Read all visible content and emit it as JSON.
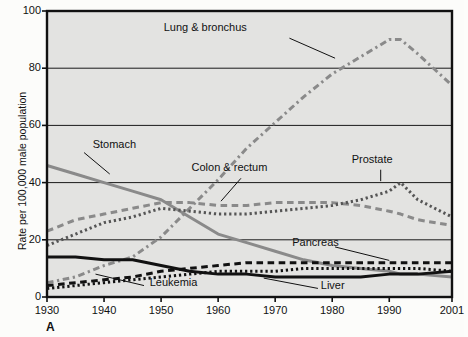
{
  "figure": {
    "panel_letter": "A",
    "background": "#e3e3e1",
    "frame_color": "#111111"
  },
  "axes": {
    "ylabel": "Rate per 100,000 male population",
    "xlabel": "",
    "yticks": [
      "0",
      "20",
      "40",
      "60",
      "80",
      "100"
    ],
    "xticks": [
      "1930",
      "1940",
      "1950",
      "1960",
      "1970",
      "1980",
      "1990",
      "2001"
    ]
  },
  "labels": {
    "lung": "Lung & bronchus",
    "stomach": "Stomach",
    "colon": "Colon & rectum",
    "prostate": "Prostate",
    "pancreas": "Pancreas",
    "leukemia": "Leukemia",
    "liver": "Liver"
  },
  "chart_data": {
    "type": "line",
    "title": "",
    "subtitle": "",
    "xlabel": "",
    "ylabel": "Rate per 100,000 male population",
    "xlim": [
      1930,
      2001
    ],
    "ylim": [
      0,
      100
    ],
    "grid": "horizontal",
    "legend_position": "inline-annotations",
    "xticks": [
      1930,
      1940,
      1950,
      1960,
      1970,
      1980,
      1990,
      2001
    ],
    "yticks": [
      0,
      20,
      40,
      60,
      80,
      100
    ],
    "x": [
      1930,
      1935,
      1940,
      1945,
      1950,
      1955,
      1960,
      1965,
      1970,
      1975,
      1980,
      1985,
      1990,
      1992,
      1995,
      2001
    ],
    "series": [
      {
        "name": "Lung & bronchus",
        "color": "#8a8a8a",
        "style": "dashdot",
        "width": 3.0,
        "values": [
          5,
          7,
          11,
          14,
          21,
          31,
          41,
          52,
          61,
          70,
          78,
          84,
          90,
          90,
          85,
          74
        ]
      },
      {
        "name": "Stomach",
        "color": "#8a8a8a",
        "style": "solid",
        "width": 3.0,
        "values": [
          46,
          43,
          40,
          37,
          34,
          28,
          22,
          19,
          16,
          13,
          11,
          10,
          9,
          8,
          8,
          7
        ]
      },
      {
        "name": "Colon & rectum",
        "color": "#8a8a8a",
        "style": "dashed",
        "width": 3.0,
        "values": [
          23,
          27,
          29,
          31,
          33,
          33,
          32,
          32,
          33,
          33,
          33,
          32,
          30,
          29,
          27,
          25
        ]
      },
      {
        "name": "Prostate",
        "color": "#555555",
        "style": "dotted",
        "width": 3.0,
        "values": [
          18,
          22,
          26,
          28,
          31,
          30,
          29,
          29,
          30,
          31,
          32,
          34,
          37,
          40,
          34,
          28
        ]
      },
      {
        "name": "Pancreas",
        "color": "#111111",
        "style": "dashed",
        "width": 3.0,
        "values": [
          4,
          5,
          6,
          7,
          9,
          10,
          11,
          12,
          12,
          12,
          12,
          12,
          12,
          12,
          12,
          12
        ]
      },
      {
        "name": "Liver",
        "color": "#111111",
        "style": "solid",
        "width": 3.0,
        "values": [
          14,
          14,
          13,
          13,
          11,
          9,
          8,
          8,
          7,
          7,
          7,
          7,
          8,
          8,
          8,
          9
        ]
      },
      {
        "name": "Leukemia",
        "color": "#111111",
        "style": "dotted",
        "width": 3.0,
        "values": [
          3,
          4,
          5,
          6,
          7,
          8,
          9,
          9,
          9,
          10,
          10,
          10,
          10,
          10,
          10,
          9
        ]
      }
    ],
    "annotations": [
      {
        "text": "Lung & bronchus",
        "x": 1965,
        "y": 94
      },
      {
        "text": "Stomach",
        "x": 1938,
        "y": 53
      },
      {
        "text": "Colon & rectum",
        "x": 1962,
        "y": 45
      },
      {
        "text": "Prostate",
        "x": 1987,
        "y": 48
      },
      {
        "text": "Pancreas",
        "x": 1973,
        "y": 19
      },
      {
        "text": "Leukemia",
        "x": 1948,
        "y": 5
      },
      {
        "text": "Liver",
        "x": 1978,
        "y": 4
      }
    ]
  }
}
